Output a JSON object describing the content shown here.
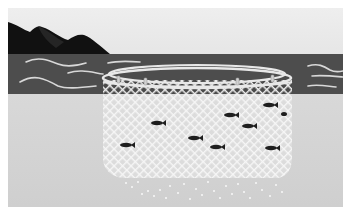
{
  "scene": {
    "subject": "fish farming net pen illustration",
    "elements": [
      "sky",
      "mountains",
      "sea-surface",
      "floating-ring",
      "net-cage",
      "fish",
      "feed-pellets",
      "underwater"
    ],
    "fish_count": 9,
    "float_count": 4,
    "colors": {
      "sky": "#ebebeb",
      "mountain": "#111111",
      "mountain_shade": "#2e2e2e",
      "sea": "#4d4d4d",
      "wave": "#d8d8d8",
      "underwater": "#d4d4d4",
      "net_mesh": "#f2f2f2",
      "ring": "#e8e8e8",
      "fish": "#1e1e1e",
      "pellet": "#f4f4f4"
    }
  }
}
